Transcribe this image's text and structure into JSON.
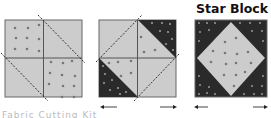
{
  "title": "Star Block 2",
  "caption": "Fabric Cutting Kit",
  "colors": {
    "light_fabric": "#cccccc",
    "dark_fabric": "#2a2a2a",
    "dots_on_light": "#777777",
    "dots_on_dark": "#999999",
    "seam": "#555555",
    "cut_line": "#333333"
  },
  "steps": [
    {
      "label": "Four-patch with diagonal cut lines"
    },
    {
      "label": "Corners cut and swapped"
    },
    {
      "label": "Star Block 2 finished"
    }
  ],
  "arrows": [
    "left-arrow",
    "right-arrow"
  ]
}
